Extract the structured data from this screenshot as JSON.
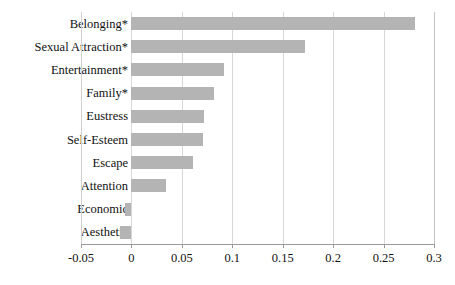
{
  "chart_data": {
    "type": "bar",
    "orientation": "horizontal",
    "title": "",
    "subtitle": "",
    "xlabel": "",
    "ylabel": "",
    "categories": [
      "Belonging*",
      "Sexual Attraction*",
      "Entertainment*",
      "Family*",
      "Eustress",
      "Self-Esteem",
      "Escape",
      "Attention",
      "Economic",
      "Aesthetic"
    ],
    "values": [
      0.281,
      0.172,
      0.092,
      0.082,
      0.072,
      0.071,
      0.061,
      0.034,
      -0.006,
      -0.011
    ],
    "xlim": [
      -0.05,
      0.3
    ],
    "xticks": [
      -0.05,
      0,
      0.05,
      0.1,
      0.15,
      0.2,
      0.25,
      0.3
    ],
    "xticklabels": [
      "-0.05",
      "0",
      "0.05",
      "0.1",
      "0.15",
      "0.2",
      "0.25",
      "0.3"
    ],
    "grid": "vertical",
    "legend": "none",
    "bar_color": "#b4b4b4",
    "gridline_color": "#d7d7d7",
    "axis_color": "#9a9a9a"
  }
}
